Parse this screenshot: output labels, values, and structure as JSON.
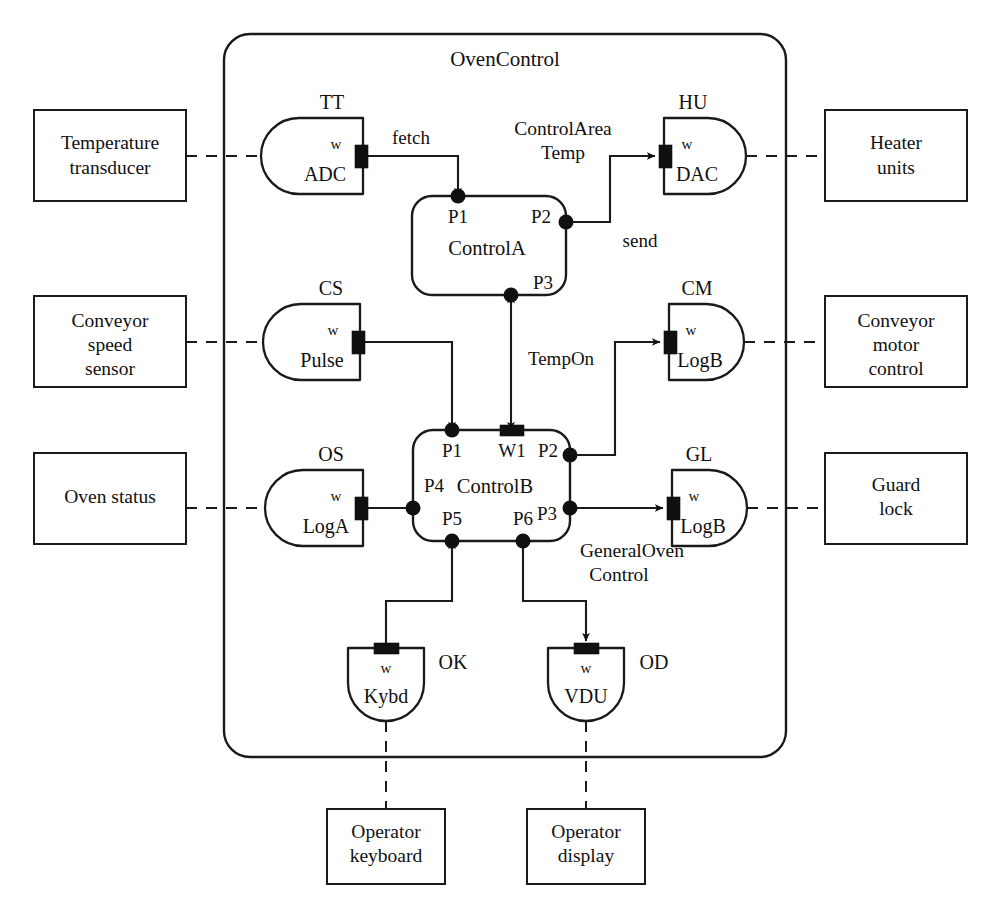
{
  "diagram": {
    "title": "OvenControl",
    "system_boundary_label": "OvenControl",
    "external_entities": [
      {
        "id": "temperature-transducer",
        "lines": [
          "Temperature",
          "transducer"
        ],
        "side": "left"
      },
      {
        "id": "conveyor-speed-sensor",
        "lines": [
          "Conveyor",
          "speed",
          "sensor"
        ],
        "side": "left"
      },
      {
        "id": "oven-status",
        "lines": [
          "Oven status"
        ],
        "side": "left"
      },
      {
        "id": "heater-units",
        "lines": [
          "Heater",
          "units"
        ],
        "side": "right"
      },
      {
        "id": "conveyor-motor-control",
        "lines": [
          "Conveyor",
          "motor",
          "control"
        ],
        "side": "right"
      },
      {
        "id": "guard-lock",
        "lines": [
          "Guard",
          "lock"
        ],
        "side": "right"
      },
      {
        "id": "operator-keyboard",
        "lines": [
          "Operator",
          "keyboard"
        ],
        "side": "bottom"
      },
      {
        "id": "operator-display",
        "lines": [
          "Operator",
          "display"
        ],
        "side": "bottom"
      }
    ],
    "device_modules": [
      {
        "id": "tt-adc",
        "tag": "TT",
        "name": "ADC",
        "port_label": "w",
        "orientation": "rounded-left"
      },
      {
        "id": "cs-pulse",
        "tag": "CS",
        "name": "Pulse",
        "port_label": "w",
        "orientation": "rounded-left"
      },
      {
        "id": "os-loga",
        "tag": "OS",
        "name": "LogA",
        "port_label": "w",
        "orientation": "rounded-left"
      },
      {
        "id": "hu-dac",
        "tag": "HU",
        "name": "DAC",
        "port_label": "w",
        "orientation": "rounded-right"
      },
      {
        "id": "cm-logb",
        "tag": "CM",
        "name": "LogB",
        "port_label": "w",
        "orientation": "rounded-right"
      },
      {
        "id": "gl-logb",
        "tag": "GL",
        "name": "LogB",
        "port_label": "w",
        "orientation": "rounded-right"
      },
      {
        "id": "ok-kybd",
        "tag": "OK",
        "name": "Kybd",
        "port_label": "w",
        "orientation": "rounded-bottom"
      },
      {
        "id": "od-vdu",
        "tag": "OD",
        "name": "VDU",
        "port_label": "w",
        "orientation": "rounded-bottom"
      }
    ],
    "control_objects": [
      {
        "id": "control-a",
        "name": "ControlA",
        "caption_lines": [
          "ControlArea",
          "Temp"
        ],
        "ports": [
          "P1",
          "P2",
          "P3"
        ]
      },
      {
        "id": "control-b",
        "name": "ControlB",
        "caption_lines": [
          "GeneralOven",
          "Control"
        ],
        "ports": [
          "P1",
          "W1",
          "P2",
          "P4",
          "P3",
          "P5",
          "P6"
        ]
      }
    ],
    "connection_labels": [
      {
        "id": "fetch",
        "text": "fetch",
        "from": "TT.w",
        "to": "ControlA.P1"
      },
      {
        "id": "send",
        "text": "send",
        "from": "ControlA.P2",
        "to": "HU.w"
      },
      {
        "id": "tempon",
        "text": "TempOn",
        "from": "ControlA.P3",
        "to": "ControlB.W1",
        "bidirectional": true
      }
    ],
    "port_labels": {
      "p1": "P1",
      "p2": "P2",
      "p3": "P3",
      "p4": "P4",
      "p5": "P5",
      "p6": "P6",
      "w1": "W1",
      "w": "w"
    },
    "colors": {
      "line": "#1a1a1a",
      "fill": "#ffffff",
      "port": "#101010"
    }
  }
}
